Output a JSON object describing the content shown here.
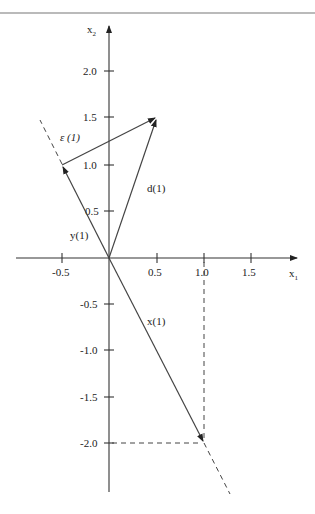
{
  "figure": {
    "axis_x_label": "x",
    "axis_x_sub": "1",
    "axis_y_label": "x",
    "axis_y_sub": "2",
    "x_ticks": [
      "-0.5",
      "0.5",
      "1.0",
      "1.5"
    ],
    "y_ticks": [
      "2.0",
      "1.5",
      "1.0",
      "0.5",
      "-0.5",
      "-1.0",
      "-1.5",
      "-2.0"
    ],
    "vectors": [
      {
        "name": "x(1)",
        "from": [
          0,
          0
        ],
        "to": [
          1.0,
          -2.0
        ]
      },
      {
        "name": "d(1)",
        "from": [
          0,
          0
        ],
        "to": [
          0.5,
          1.5
        ]
      },
      {
        "name": "y(1)",
        "from": [
          0,
          0
        ],
        "to": [
          -0.5,
          1.0
        ]
      },
      {
        "name": "ε(1)",
        "from": [
          -0.5,
          1.0
        ],
        "to": [
          0.5,
          1.5
        ]
      }
    ],
    "labels": {
      "x1": "x(1)",
      "d1": "d(1)",
      "y1": "y(1)",
      "eps1": "ε (1)"
    }
  }
}
